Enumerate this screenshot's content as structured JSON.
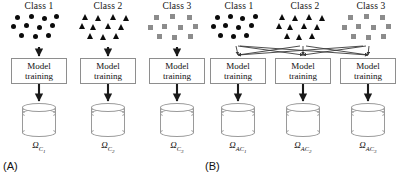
{
  "figure": {
    "panels": [
      {
        "id": "A",
        "label": "(A)",
        "classes": [
          {
            "title": "Class 1",
            "marker": "circle-marker",
            "count": 10
          },
          {
            "title": "Class 2",
            "marker": "triangle-marker",
            "count": 10
          },
          {
            "title": "Class 3",
            "marker": "square-marker",
            "count": 10
          }
        ],
        "boxes": [
          {
            "line1": "Model",
            "line2": "training"
          },
          {
            "line1": "Model",
            "line2": "training"
          },
          {
            "line1": "Model",
            "line2": "training"
          }
        ],
        "datastores": [
          {
            "symbol": "Ω",
            "sub": "C",
            "subsub": "1"
          },
          {
            "symbol": "Ω",
            "sub": "C",
            "subsub": "2"
          },
          {
            "symbol": "Ω",
            "sub": "C",
            "subsub": "3"
          }
        ]
      },
      {
        "id": "B",
        "label": "(B)",
        "classes": [
          {
            "title": "Class 1",
            "marker": "circle-marker",
            "count": 10
          },
          {
            "title": "Class 2",
            "marker": "triangle-marker",
            "count": 10
          },
          {
            "title": "Class 3",
            "marker": "square-marker",
            "count": 10
          }
        ],
        "boxes": [
          {
            "line1": "Model",
            "line2": "training"
          },
          {
            "line1": "Model",
            "line2": "training"
          },
          {
            "line1": "Model",
            "line2": "training"
          }
        ],
        "datastores": [
          {
            "symbol": "Ω",
            "sub": "AC",
            "subsub": "1"
          },
          {
            "symbol": "Ω",
            "sub": "AC",
            "subsub": "2"
          },
          {
            "symbol": "Ω",
            "sub": "AC",
            "subsub": "3"
          }
        ]
      }
    ],
    "colors": {
      "marker_dark": "#0b0b0b",
      "marker_gray": "#8c8c8c",
      "box_border": "#8e8e8e",
      "cylinder_stroke": "#9a9a9a",
      "arrow": "#1a1a1a",
      "cross_arrow": "#4a4a4a"
    }
  }
}
